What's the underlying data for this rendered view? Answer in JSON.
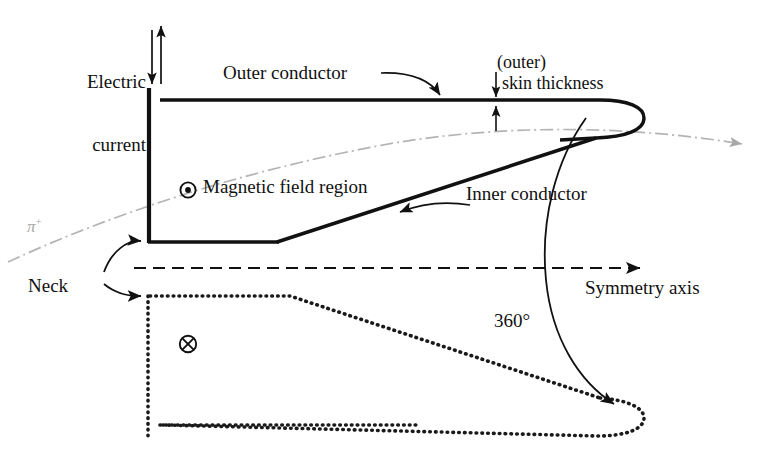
{
  "figure": {
    "type": "technical-cross-section-diagram"
  },
  "labels": {
    "electric_current_line1": "Electric",
    "electric_current_line2": "current",
    "outer_conductor": "Outer conductor",
    "skin_thickness_line1": "(outer)",
    "skin_thickness_line2": "skin thickness",
    "magnetic_field_region": "Magnetic field region",
    "inner_conductor": "Inner conductor",
    "neck": "Neck",
    "symmetry_axis": "Symmetry axis",
    "rotation_angle": "360°",
    "pion_symbol": "π",
    "pion_charge": "+"
  },
  "icons": {
    "field_out_of_page": "circle-dot-icon",
    "field_into_page": "circle-cross-icon"
  },
  "colors": {
    "ink": "#111111",
    "pion_trajectory": "#b0b0b0",
    "mirror_dotted": "#1a1a1a",
    "background": "#ffffff"
  },
  "geometry": {
    "symmetry_axis_y": 268,
    "neck_x": 148,
    "conductor_nose_x": 640,
    "outer_top_y": 100
  }
}
